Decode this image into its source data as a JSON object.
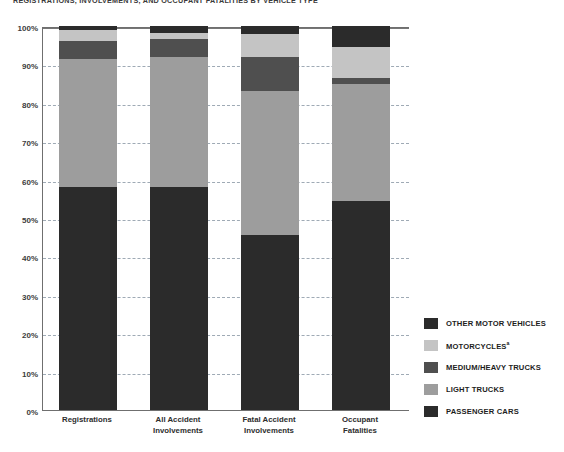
{
  "chart_data": {
    "type": "bar",
    "subtype": "stacked-100-percent",
    "title": "REGISTRATIONS, INVOLVEMENTS, AND OCCUPANT FATALITIES BY VEHICLE TYPE",
    "xlabel": "",
    "ylabel": "",
    "ylim": [
      0,
      100
    ],
    "yticks": [
      "0%",
      "10%",
      "20%",
      "30%",
      "40%",
      "50%",
      "60%",
      "70%",
      "80%",
      "90%",
      "100%"
    ],
    "ytick_values": [
      0,
      10,
      20,
      30,
      40,
      50,
      60,
      70,
      80,
      90,
      100
    ],
    "grid": true,
    "grid_axis": "y",
    "legend_position": "right",
    "categories": [
      "Registrations",
      "All Accident Involvements",
      "Fatal Accident Involvements",
      "Occupant Fatalities"
    ],
    "series": [
      {
        "name": "PASSENGER CARS",
        "values": [
          58.0,
          58.0,
          45.5,
          54.5
        ],
        "color": "#2b2b2b"
      },
      {
        "name": "LIGHT TRUCKS",
        "values": [
          33.5,
          34.0,
          37.5,
          30.5
        ],
        "color": "#9d9d9d"
      },
      {
        "name": "MEDIUM/HEAVY TRUCKS",
        "values": [
          4.5,
          4.5,
          9.0,
          1.5
        ],
        "color": "#4f4f4f"
      },
      {
        "name": "MOTORCYCLES",
        "values": [
          3.0,
          1.8,
          6.0,
          8.0
        ],
        "color": "#c4c4c4"
      },
      {
        "name": "OTHER MOTOR VEHICLES",
        "values": [
          1.0,
          1.7,
          2.0,
          5.5
        ],
        "color": "#2b2b2b"
      }
    ]
  },
  "legend": {
    "items": [
      {
        "label": "OTHER MOTOR VEHICLES",
        "color": "#2b2b2b",
        "footnote": ""
      },
      {
        "label": "MOTORCYCLES",
        "color": "#c4c4c4",
        "footnote": "a"
      },
      {
        "label": "MEDIUM/HEAVY TRUCKS",
        "color": "#4f4f4f",
        "footnote": ""
      },
      {
        "label": "LIGHT TRUCKS",
        "color": "#9d9d9d",
        "footnote": ""
      },
      {
        "label": "PASSENGER CARS",
        "color": "#2b2b2b",
        "footnote": ""
      }
    ]
  },
  "axis": {
    "x_labels": [
      {
        "line1": "Registrations",
        "line2": ""
      },
      {
        "line1": "All Accident",
        "line2": "Involvements"
      },
      {
        "line1": "Fatal Accident",
        "line2": "Involvements"
      },
      {
        "line1": "Occupant",
        "line2": "Fatalities"
      }
    ]
  },
  "colors": {
    "grid": "#9aa6b2",
    "axis": "#6f6f6f",
    "background": "#ffffff",
    "text": "#2d2d2d"
  }
}
